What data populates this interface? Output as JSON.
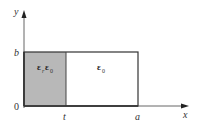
{
  "diagram": {
    "axes": {
      "x_label": "x",
      "y_label": "y",
      "origin_label": "0"
    },
    "ticks": {
      "y_top": "b",
      "x_mid": "t",
      "x_right": "a"
    },
    "regions": [
      {
        "name": "dielectric",
        "label": "ε_r ε_0",
        "label_main": "ε",
        "label_sub": "r",
        "label_main2": "ε",
        "label_sub2": "0",
        "fill": "#b8b8b8",
        "x_from": "0",
        "x_to": "t"
      },
      {
        "name": "free-space",
        "label": "ε_0",
        "label_main": "ε",
        "label_sub": "0",
        "fill": "#ffffff",
        "x_from": "t",
        "x_to": "a"
      }
    ],
    "colors": {
      "stroke": "#333333",
      "axis": "#555555",
      "shade": "#b8b8b8"
    }
  }
}
